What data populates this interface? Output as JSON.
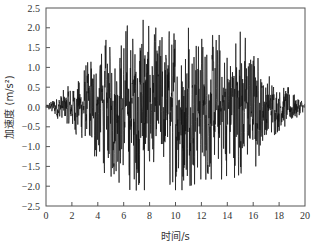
{
  "chart_data": {
    "type": "line",
    "title": "",
    "xlabel": "时间/s",
    "ylabel": "加速度 (m/s²)",
    "xlim": [
      0,
      20
    ],
    "ylim": [
      -2.5,
      2.5
    ],
    "x_ticks": [
      0,
      2,
      4,
      6,
      8,
      10,
      12,
      14,
      16,
      18,
      20
    ],
    "x_tick_labels": [
      "0",
      "2",
      "4",
      "6",
      "8",
      "10",
      "12",
      "14",
      "16",
      "18",
      "20"
    ],
    "y_ticks": [
      2.5,
      2.0,
      1.5,
      1.0,
      0.5,
      0.0,
      -0.5,
      -1.0,
      -1.5,
      -2.0,
      -2.5
    ],
    "y_tick_labels": [
      "2.5",
      "2.0",
      "1.5",
      "1.0",
      "0.5",
      "0.0",
      "-0.5",
      "-1.0",
      "-1.5",
      "-2.0",
      "-2.5"
    ],
    "grid": false,
    "legend": null,
    "line_color": "#111111",
    "envelope": {
      "t": [
        0,
        1,
        2,
        3,
        4,
        5,
        6,
        7,
        8,
        9,
        10,
        11,
        12,
        13,
        14,
        15,
        16,
        17,
        18,
        19,
        20
      ],
      "peak_abs": [
        0.05,
        0.35,
        0.6,
        1.0,
        1.6,
        1.75,
        2.0,
        2.2,
        2.05,
        1.95,
        2.1,
        2.0,
        1.9,
        1.8,
        1.85,
        1.9,
        1.5,
        0.9,
        0.6,
        0.45,
        0.1
      ]
    },
    "notable_peaks": [
      {
        "t": 7.5,
        "value": 2.2
      },
      {
        "t": 7.6,
        "value": -2.1
      },
      {
        "t": 10.5,
        "value": -2.1
      },
      {
        "t": 11.0,
        "value": 2.0
      },
      {
        "t": 15.0,
        "value": 1.9
      },
      {
        "t": 16.2,
        "value": -1.5
      }
    ]
  },
  "plot_area": {
    "left": 46,
    "right": 305,
    "top": 8,
    "bottom": 206
  }
}
